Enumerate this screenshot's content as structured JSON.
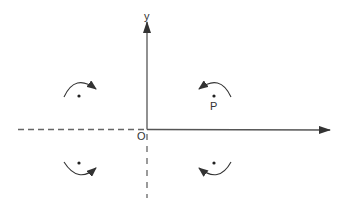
{
  "diagram": {
    "type": "coordinate-plane-rotations",
    "colors": {
      "stroke": "#444444",
      "axis": "#555555",
      "background": "#ffffff"
    },
    "labels": {
      "y_axis": "y",
      "origin": "O",
      "point": "P"
    },
    "axes": {
      "origin": [
        147,
        129
      ],
      "x_positive_end": [
        330,
        130
      ],
      "x_negative_end": [
        18,
        129
      ],
      "y_positive_end": [
        147,
        22
      ],
      "y_negative_end": [
        147,
        198
      ],
      "negative_style": "dashed"
    },
    "quadrant_markers": [
      {
        "quadrant": "II",
        "dot": [
          79,
          96
        ],
        "arc": "above",
        "arrow_direction": "right",
        "rotation": "clockwise"
      },
      {
        "quadrant": "I",
        "dot": [
          214,
          96
        ],
        "arc": "above",
        "arrow_direction": "left",
        "rotation": "counter-clockwise",
        "label": "P"
      },
      {
        "quadrant": "III",
        "dot": [
          79,
          163
        ],
        "arc": "below",
        "arrow_direction": "right",
        "rotation": "counter-clockwise"
      },
      {
        "quadrant": "IV",
        "dot": [
          214,
          163
        ],
        "arc": "below",
        "arrow_direction": "left",
        "rotation": "clockwise"
      }
    ]
  }
}
